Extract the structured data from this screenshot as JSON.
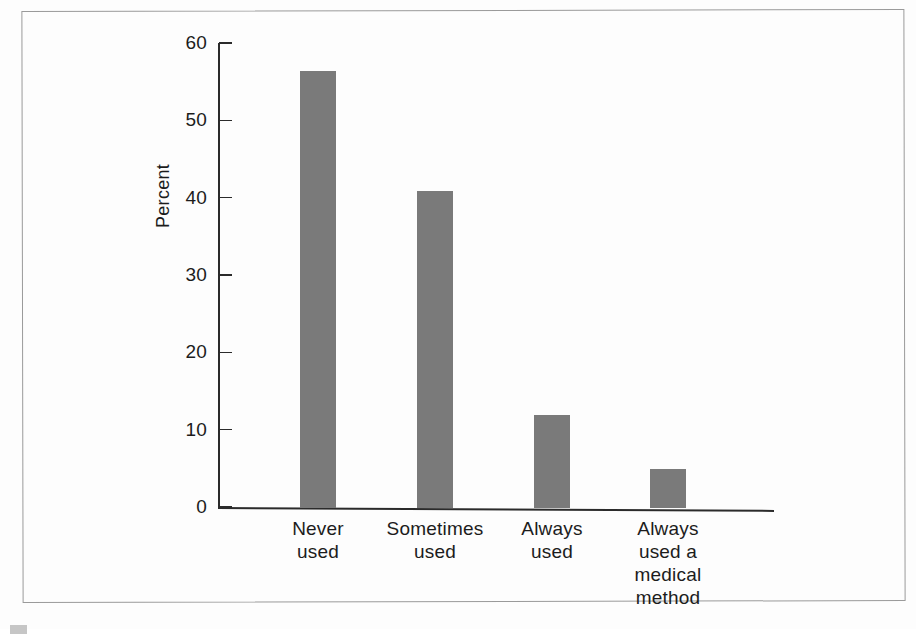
{
  "figure": {
    "background_color": "#fdfdfd",
    "frame_color": "#9a9a9a",
    "axis_color": "#2b2b2b",
    "bar_color": "#7a7a7a"
  },
  "chart_data": {
    "type": "bar",
    "title": "",
    "subtitle": "",
    "xlabel": "",
    "ylabel": "Percent",
    "ylim": [
      0,
      60
    ],
    "ytick_values": [
      0,
      10,
      20,
      30,
      40,
      50,
      60
    ],
    "ytick_labels": [
      "0",
      "10",
      "20",
      "30",
      "40",
      "50",
      "60"
    ],
    "grid": false,
    "legend": null,
    "categories": [
      "Never used",
      "Sometimes used",
      "Always used",
      "Always used a medical method"
    ],
    "category_lines": [
      [
        "Never",
        "used"
      ],
      [
        "Sometimes",
        "used"
      ],
      [
        "Always",
        "used"
      ],
      [
        "Always",
        "used a",
        "medical",
        "method"
      ]
    ],
    "values": [
      56.5,
      41,
      12,
      5
    ],
    "annotations": []
  },
  "bottom_caption": {
    "text": "cut-off caption line"
  }
}
